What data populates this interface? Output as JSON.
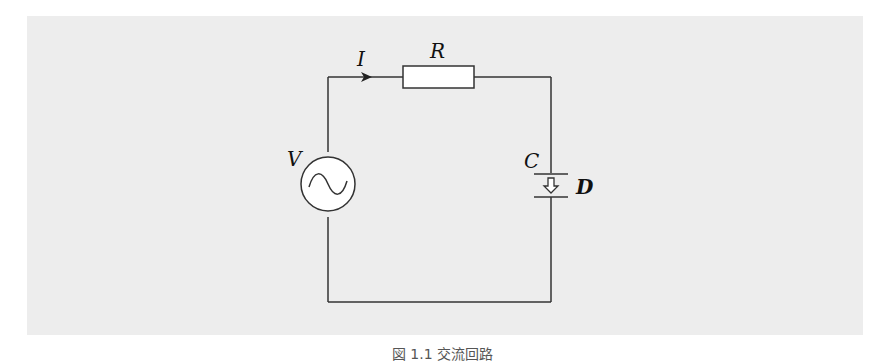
{
  "diagram": {
    "type": "ac-rc-circuit",
    "labels": {
      "current": "I",
      "resistor": "R",
      "source": "V",
      "capacitor": "C",
      "displacement": "D"
    },
    "caption": "図 1.1  交流回路"
  }
}
